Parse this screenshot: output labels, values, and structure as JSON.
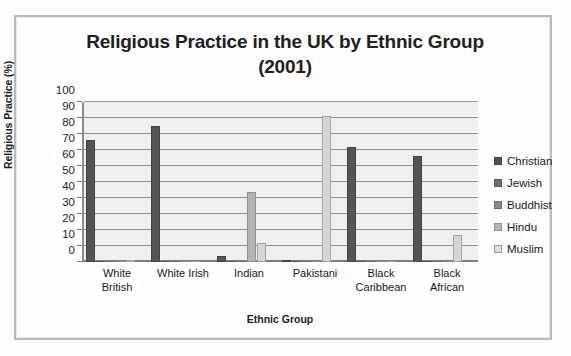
{
  "chart_data": {
    "type": "bar",
    "title": "Religious Practice in the UK by Ethnic Group (2001)",
    "title_line1": "Religious Practice in the UK by Ethnic Group",
    "title_line2": "(2001)",
    "xlabel": "Ethnic Group",
    "ylabel": "Religious Practice (%)",
    "ylim": [
      0,
      100
    ],
    "ytick_labels": [
      "100",
      "90",
      "80",
      "70",
      "60",
      "50",
      "40",
      "30",
      "20",
      "10",
      "0"
    ],
    "ytick_values": [
      100,
      90,
      80,
      70,
      60,
      50,
      40,
      30,
      20,
      10,
      0
    ],
    "grid": "horizontal",
    "legend_position": "right",
    "categories": [
      "White British",
      "White Irish",
      "Indian",
      "Pakistani",
      "Black Caribbean",
      "Black African"
    ],
    "category_lines": [
      [
        "White",
        "British"
      ],
      [
        "White Irish",
        ""
      ],
      [
        "Indian",
        ""
      ],
      [
        "Pakistani",
        ""
      ],
      [
        "Black",
        "Caribbean"
      ],
      [
        "Black",
        "African"
      ]
    ],
    "series": [
      {
        "name": "Christian",
        "color": "#545454",
        "values": [
          76,
          85,
          4,
          1,
          72,
          66
        ]
      },
      {
        "name": "Jewish",
        "color": "#6d6d6d",
        "values": [
          0,
          0,
          0,
          0,
          0,
          0
        ]
      },
      {
        "name": "Buddhist",
        "color": "#8a8a8a",
        "values": [
          0,
          0,
          0,
          0,
          0,
          0
        ]
      },
      {
        "name": "Hindu",
        "color": "#b4b4b4",
        "values": [
          0,
          0,
          44,
          0,
          0,
          0
        ]
      },
      {
        "name": "Muslim",
        "color": "#d5d5d5",
        "values": [
          1,
          0,
          12,
          91,
          0,
          17
        ]
      }
    ]
  }
}
